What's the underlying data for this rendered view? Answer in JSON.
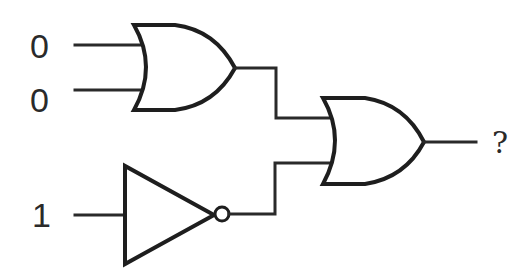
{
  "diagram": {
    "type": "logic-circuit",
    "inputs": [
      {
        "label": "0",
        "target": "or-gate-1"
      },
      {
        "label": "0",
        "target": "or-gate-1"
      },
      {
        "label": "1",
        "target": "not-gate"
      }
    ],
    "gates": [
      {
        "id": "or-gate-1",
        "kind": "OR",
        "inputs": [
          "0",
          "0"
        ]
      },
      {
        "id": "not-gate",
        "kind": "NOT",
        "inputs": [
          "1"
        ]
      },
      {
        "id": "or-gate-2",
        "kind": "OR",
        "inputs": [
          "or-gate-1",
          "not-gate"
        ]
      }
    ],
    "output": {
      "label": "?",
      "source": "or-gate-2"
    }
  }
}
